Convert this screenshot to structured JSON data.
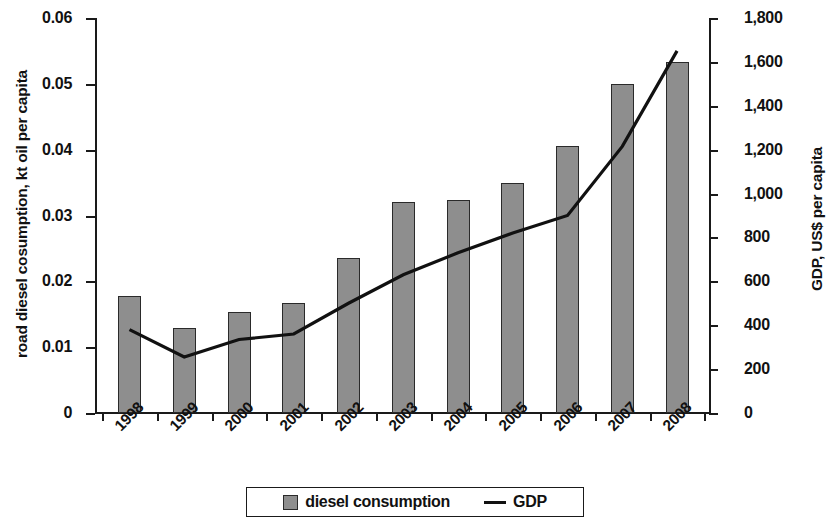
{
  "chart_data": {
    "type": "bar",
    "title": "",
    "subtitle": "",
    "xlabel": "",
    "ylabel": "road diesel cosumption, kt oil per capita",
    "y2label": "GDP, US$ per capita",
    "categories": [
      "1998",
      "1999",
      "2000",
      "2001",
      "2002",
      "2003",
      "2004",
      "2005",
      "2006",
      "2007",
      "2008"
    ],
    "ylim": [
      0,
      0.06
    ],
    "y2lim": [
      0,
      1800
    ],
    "ytick_labels": [
      "0.06",
      "0.05",
      "0.04",
      "0.03",
      "0.02",
      "0.01",
      "0"
    ],
    "ytick_values": [
      0.06,
      0.05,
      0.04,
      0.03,
      0.02,
      0.01,
      0
    ],
    "y2tick_labels": [
      "1,800",
      "1,600",
      "1,400",
      "1,200",
      "1,000",
      "800",
      "600",
      "400",
      "200",
      "0"
    ],
    "y2tick_values": [
      1800,
      1600,
      1400,
      1200,
      1000,
      800,
      600,
      400,
      200,
      0
    ],
    "grid": false,
    "legend_position": "bottom-center",
    "series": [
      {
        "name": "diesel consumption",
        "type": "bar",
        "axis": "left",
        "color": "#8e8e8e",
        "values": [
          0.0178,
          0.0129,
          0.0154,
          0.0167,
          0.0236,
          0.0321,
          0.0324,
          0.035,
          0.0405,
          0.0499,
          0.0533
        ]
      },
      {
        "name": "GDP",
        "type": "line",
        "axis": "right",
        "color": "#111111",
        "values": [
          380,
          255,
          335,
          360,
          500,
          630,
          730,
          820,
          900,
          1215,
          1650
        ]
      }
    ]
  },
  "legend": {
    "bar_label": "diesel consumption",
    "line_label": "GDP"
  }
}
